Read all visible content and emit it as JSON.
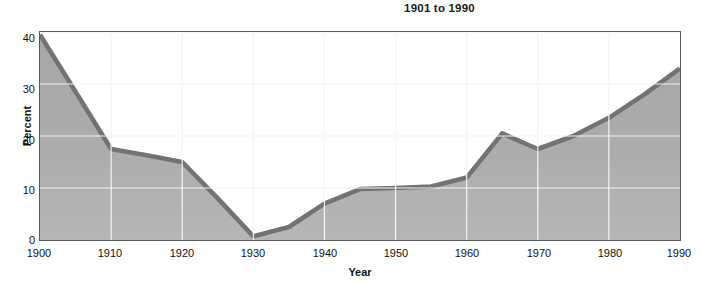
{
  "chart_data": {
    "type": "area",
    "title": "1901 to 1990",
    "xlabel": "Year",
    "ylabel": "Percent",
    "xlim": [
      1900,
      1990
    ],
    "ylim": [
      0,
      40
    ],
    "grid": true,
    "legend": "none",
    "x_ticks": [
      "1900",
      "1910",
      "1920",
      "1930",
      "1940",
      "1950",
      "1960",
      "1970",
      "1980",
      "1990"
    ],
    "y_ticks": [
      "0",
      "10",
      "20",
      "30",
      "40"
    ],
    "x": [
      1900,
      1905,
      1910,
      1915,
      1920,
      1925,
      1930,
      1935,
      1940,
      1945,
      1950,
      1955,
      1960,
      1965,
      1970,
      1975,
      1980,
      1985,
      1990
    ],
    "values": [
      39.5,
      28.5,
      17.5,
      16.3,
      15.0,
      8.0,
      0.7,
      2.5,
      7.0,
      9.8,
      10.0,
      10.3,
      12.0,
      20.5,
      17.5,
      20.0,
      23.5,
      28.0,
      33.0
    ],
    "series": [
      {
        "name": "Percent",
        "values": [
          39.5,
          28.5,
          17.5,
          16.3,
          15.0,
          8.0,
          0.7,
          2.5,
          7.0,
          9.8,
          10.0,
          10.3,
          12.0,
          20.5,
          17.5,
          20.0,
          23.5,
          28.0,
          33.0
        ]
      }
    ],
    "colors": {
      "line": "#737373",
      "fill": "#a9a9a9",
      "fill_bottom": "#b5b5b5",
      "grid": "#f2f2f2",
      "frame": "#5a5a5a",
      "text": "#111111"
    }
  }
}
